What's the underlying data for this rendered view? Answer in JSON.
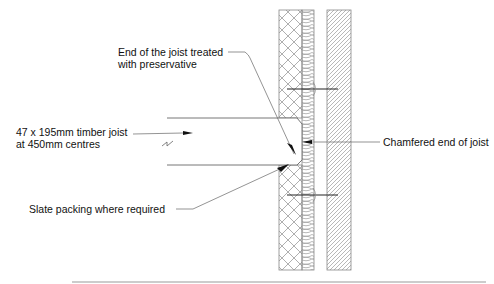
{
  "diagram": {
    "type": "construction-detail",
    "labels": {
      "preservative_line1": "End of the joist treated",
      "preservative_line2": "with preservative",
      "joist_line1": "47 x 195mm timber joist",
      "joist_line2": "at 450mm centres",
      "chamfer": "Chamfered end of joist",
      "slate": "Slate packing where required"
    },
    "colors": {
      "line": "#555555",
      "hatch": "#9a9a9a",
      "arrow": "#111111",
      "background": "#ffffff"
    }
  }
}
